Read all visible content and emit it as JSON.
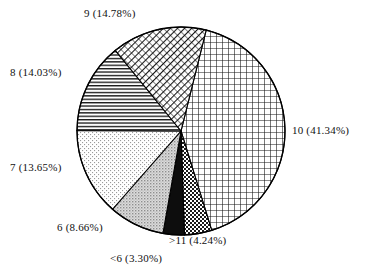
{
  "chart_data": {
    "type": "pie",
    "title": "",
    "subtitle": "",
    "xlabel": "",
    "ylabel": "",
    "legend_position": "none",
    "grid": false,
    "labels": [
      "10",
      "9",
      "8",
      "7",
      "6",
      ">11",
      "<6"
    ],
    "categories": [
      "10",
      "9",
      "8",
      "7",
      "6",
      ">11",
      "<6"
    ],
    "values": [
      41.34,
      14.78,
      14.03,
      13.65,
      8.66,
      4.24,
      3.3
    ],
    "units": "percent",
    "annotations": [
      "10 (41.34%)",
      "9 (14.78%)",
      "8 (14.03%)",
      "7 (13.65%)",
      "6 (8.66%)",
      ">11 (4.24%)",
      "<6 (3.30%)"
    ],
    "slices": [
      {
        "label": "10",
        "value": 41.34,
        "text": "10 (41.34%)",
        "pattern": "grid-crosshatch",
        "start_angle": 14.0,
        "end_angle": 162.8,
        "fill": "#ffffff",
        "stroke": "#000000"
      },
      {
        "label": ">11",
        "value": 4.24,
        "text": ">11 (4.24%)",
        "pattern": "dark-checkerboard",
        "start_angle": 162.8,
        "end_angle": 178.1,
        "fill": "#5a5a5a",
        "stroke": "#000000"
      },
      {
        "label": "<6",
        "value": 3.3,
        "text": "<6 (3.30%)",
        "pattern": "solid-black",
        "start_angle": 178.1,
        "end_angle": 190.0,
        "fill": "#0d0d0d",
        "stroke": "#000000"
      },
      {
        "label": "6",
        "value": 8.66,
        "text": "6 (8.66%)",
        "pattern": "gray-stipple",
        "start_angle": 190.0,
        "end_angle": 221.2,
        "fill": "#c9c9c9",
        "stroke": "#000000"
      },
      {
        "label": "7",
        "value": 13.65,
        "text": "7 (13.65%)",
        "pattern": "light-dots",
        "start_angle": 221.2,
        "end_angle": 270.3,
        "fill": "#f4f4f4",
        "stroke": "#000000"
      },
      {
        "label": "8",
        "value": 14.03,
        "text": "8 (14.03%)",
        "pattern": "horizontal-lines",
        "start_angle": 270.3,
        "end_angle": 320.8,
        "fill": "#b8b8b8",
        "stroke": "#000000"
      },
      {
        "label": "9",
        "value": 14.78,
        "text": "9 (14.78%)",
        "pattern": "diagonal-hatch",
        "start_angle": 320.8,
        "end_angle": 374.0,
        "fill": "#8f8f8f",
        "stroke": "#000000"
      }
    ],
    "geometry": {
      "center_x": 181,
      "center_y": 131,
      "radius": 104
    },
    "background": "#ffffff",
    "accent": "#000000"
  },
  "labels": {
    "slice_10": "10 (41.34%)",
    "slice_9": "9 (14.78%)",
    "slice_8": "8 (14.03%)",
    "slice_7": "7 (13.65%)",
    "slice_6": "6 (8.66%)",
    "slice_gt11": ">11 (4.24%)",
    "slice_lt6": "<6 (3.30%)"
  }
}
